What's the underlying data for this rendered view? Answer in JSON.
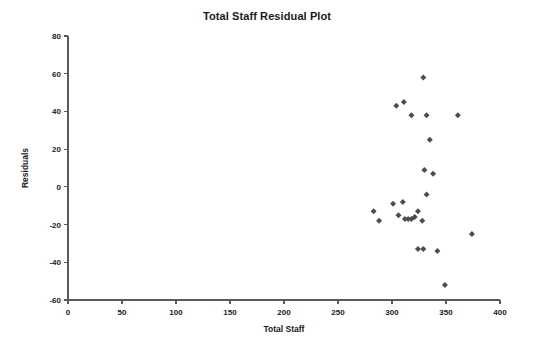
{
  "chart_data": {
    "type": "scatter",
    "title": "Total Staff Residual Plot",
    "xlabel": "Total Staff",
    "ylabel": "Residuals",
    "xlim": [
      0,
      400
    ],
    "ylim": [
      -60,
      80
    ],
    "xticks": [
      0,
      50,
      100,
      150,
      200,
      250,
      300,
      350,
      400
    ],
    "yticks": [
      -60,
      -40,
      -20,
      0,
      20,
      40,
      60,
      80
    ],
    "xtick_labels": [
      "0",
      "50",
      "100",
      "150",
      "200",
      "250",
      "300",
      "350",
      "400"
    ],
    "ytick_labels": [
      "-60",
      "-40",
      "-20",
      "0",
      "20",
      "40",
      "60",
      "80"
    ],
    "grid": false,
    "legend": false,
    "marker": "diamond",
    "marker_color": "#4d4d4d",
    "points": [
      {
        "x": 329,
        "y": 58
      },
      {
        "x": 304,
        "y": 43
      },
      {
        "x": 311,
        "y": 45
      },
      {
        "x": 361,
        "y": 38
      },
      {
        "x": 318,
        "y": 38
      },
      {
        "x": 332,
        "y": 38
      },
      {
        "x": 335,
        "y": 25
      },
      {
        "x": 330,
        "y": 9
      },
      {
        "x": 338,
        "y": 7
      },
      {
        "x": 332,
        "y": -4
      },
      {
        "x": 283,
        "y": -13
      },
      {
        "x": 288,
        "y": -18
      },
      {
        "x": 301,
        "y": -9
      },
      {
        "x": 310,
        "y": -8
      },
      {
        "x": 306,
        "y": -15
      },
      {
        "x": 312,
        "y": -17
      },
      {
        "x": 315,
        "y": -17
      },
      {
        "x": 318,
        "y": -17
      },
      {
        "x": 321,
        "y": -16
      },
      {
        "x": 324,
        "y": -13
      },
      {
        "x": 328,
        "y": -18
      },
      {
        "x": 374,
        "y": -25
      },
      {
        "x": 324,
        "y": -33
      },
      {
        "x": 329,
        "y": -33
      },
      {
        "x": 342,
        "y": -34
      },
      {
        "x": 349,
        "y": -52
      }
    ]
  }
}
